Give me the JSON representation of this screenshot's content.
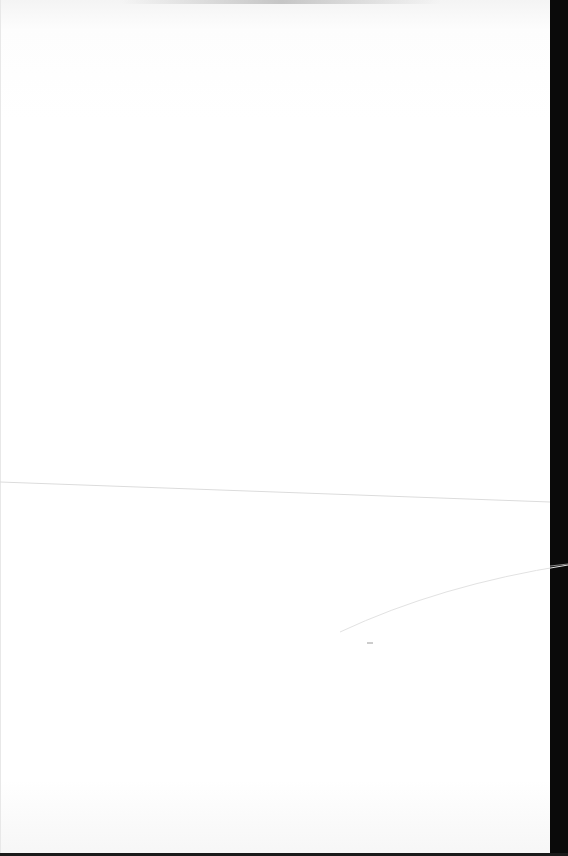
{
  "document": {
    "type": "blank scanned page",
    "text": "",
    "colors": {
      "page": "#ffffff",
      "background": "#000000",
      "fold_line": "#d8d8d8"
    },
    "marks": {
      "fold_line": {
        "from": [
          0,
          482
        ],
        "to": [
          550,
          502
        ]
      },
      "curve_line": {
        "from": [
          340,
          632
        ],
        "to": [
          568,
          565
        ]
      },
      "small_mark": {
        "x": 370,
        "y": 643
      }
    }
  }
}
